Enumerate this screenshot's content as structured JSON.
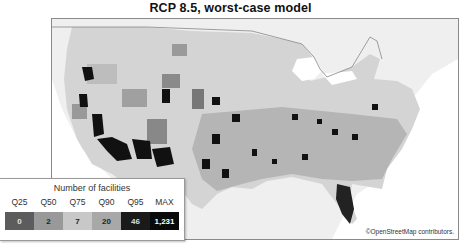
{
  "title": "RCP 8.5, worst-case model",
  "map": {
    "attribution": "©OpenStreetMap contributors.",
    "region": "Contiguous United States (county choropleth)"
  },
  "legend": {
    "title": "Number of facilities",
    "bins": [
      {
        "label": "Q25",
        "value": "0",
        "color": "#5c5c5c",
        "text_color": "#e0e0e0"
      },
      {
        "label": "Q50",
        "value": "2",
        "color": "#999999",
        "text_color": "#222222"
      },
      {
        "label": "Q75",
        "value": "7",
        "color": "#c8c8c8",
        "text_color": "#222222"
      },
      {
        "label": "Q90",
        "value": "20",
        "color": "#a8a8a8",
        "text_color": "#222222"
      },
      {
        "label": "Q95",
        "value": "46",
        "color": "#1a1a1a",
        "text_color": "#dddddd"
      },
      {
        "label": "MAX",
        "value": "1,231",
        "color": "#0a0a0a",
        "text_color": "#ffffff"
      }
    ]
  }
}
